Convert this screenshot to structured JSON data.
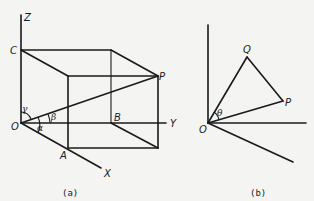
{
  "figure_a": {
    "caption": "(a)",
    "axes": {
      "z": "Z",
      "y": "Y",
      "x": "X"
    },
    "points": {
      "origin": "O",
      "c": "C",
      "p": "P",
      "b": "B",
      "a": "A"
    },
    "angles": {
      "alpha": "α",
      "beta": "β",
      "gamma": "γ"
    }
  },
  "figure_b": {
    "caption": "(b)",
    "points": {
      "origin": "O",
      "q": "Q",
      "p": "P"
    },
    "angles": {
      "theta": "θ"
    }
  },
  "colors": {
    "line": "#1a1a1a",
    "background": "#f4f4f2"
  }
}
